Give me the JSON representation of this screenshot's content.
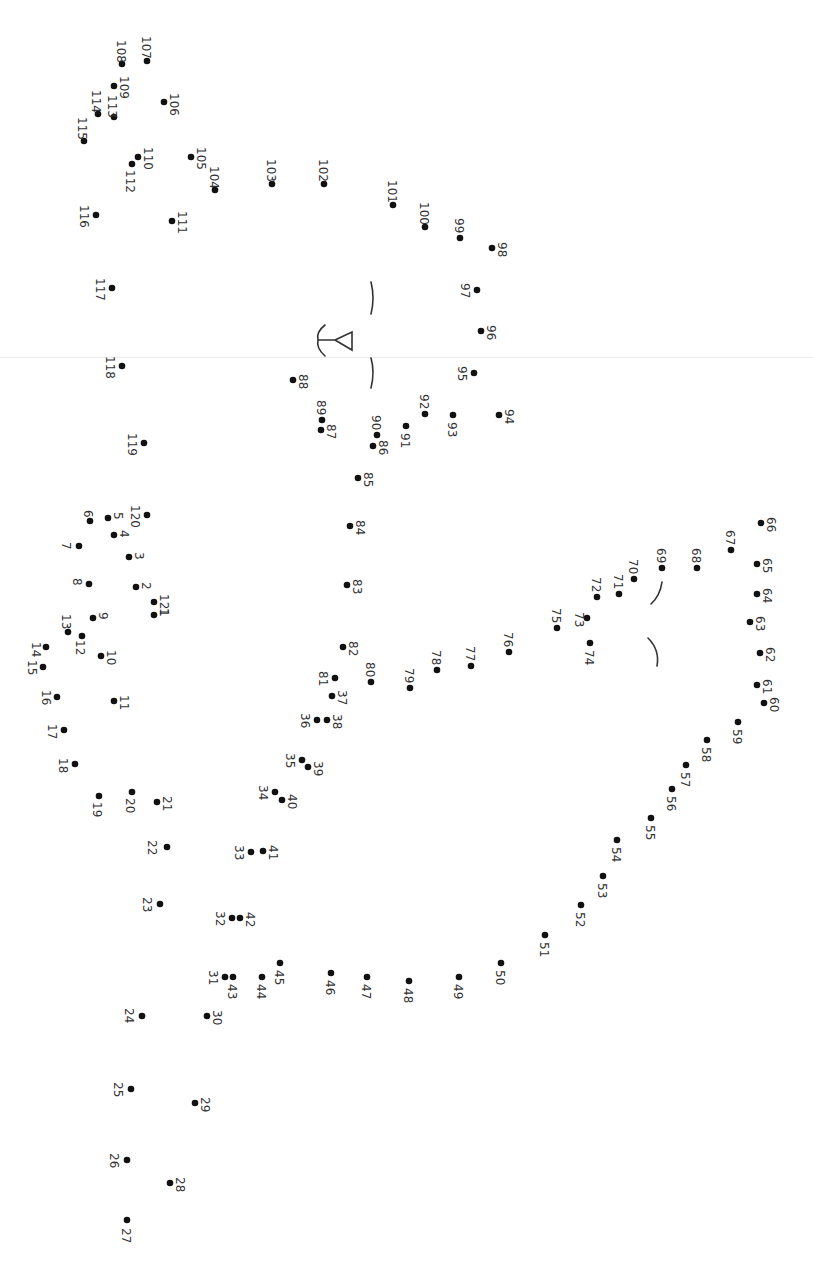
{
  "worksheet": {
    "type": "connect-the-dots",
    "orientation": "rotated-90-clockwise",
    "total_dots": 121,
    "colors": {
      "background": "#ffffff",
      "dot": "#111111",
      "label": "#333333",
      "fold_line": "#ececec"
    },
    "dots": [
      {
        "n": "1",
        "x": 154,
        "y": 615,
        "lx": 160,
        "ly": 608
      },
      {
        "n": "2",
        "x": 136,
        "y": 587,
        "lx": 142,
        "ly": 582
      },
      {
        "n": "3",
        "x": 129,
        "y": 557,
        "lx": 135,
        "ly": 552
      },
      {
        "n": "4",
        "x": 114,
        "y": 535,
        "lx": 120,
        "ly": 530
      },
      {
        "n": "5",
        "x": 108,
        "y": 518,
        "lx": 114,
        "ly": 512
      },
      {
        "n": "6",
        "x": 90,
        "y": 521,
        "lx": 84,
        "ly": 510
      },
      {
        "n": "7",
        "x": 79,
        "y": 546,
        "lx": 62,
        "ly": 542
      },
      {
        "n": "8",
        "x": 89,
        "y": 584,
        "lx": 73,
        "ly": 578
      },
      {
        "n": "9",
        "x": 93,
        "y": 618,
        "lx": 99,
        "ly": 612
      },
      {
        "n": "10",
        "x": 101,
        "y": 656,
        "lx": 107,
        "ly": 650
      },
      {
        "n": "11",
        "x": 114,
        "y": 701,
        "lx": 120,
        "ly": 695
      },
      {
        "n": "12",
        "x": 82,
        "y": 636,
        "lx": 76,
        "ly": 640
      },
      {
        "n": "13",
        "x": 68,
        "y": 632,
        "lx": 62,
        "ly": 614
      },
      {
        "n": "14",
        "x": 46,
        "y": 647,
        "lx": 32,
        "ly": 642
      },
      {
        "n": "15",
        "x": 43,
        "y": 667,
        "lx": 28,
        "ly": 660
      },
      {
        "n": "16",
        "x": 57,
        "y": 697,
        "lx": 42,
        "ly": 690
      },
      {
        "n": "17",
        "x": 64,
        "y": 730,
        "lx": 48,
        "ly": 724
      },
      {
        "n": "18",
        "x": 75,
        "y": 764,
        "lx": 59,
        "ly": 758
      },
      {
        "n": "19",
        "x": 99,
        "y": 796,
        "lx": 93,
        "ly": 802
      },
      {
        "n": "20",
        "x": 132,
        "y": 792,
        "lx": 126,
        "ly": 798
      },
      {
        "n": "21",
        "x": 157,
        "y": 802,
        "lx": 163,
        "ly": 796
      },
      {
        "n": "22",
        "x": 167,
        "y": 847,
        "lx": 148,
        "ly": 840
      },
      {
        "n": "23",
        "x": 160,
        "y": 904,
        "lx": 143,
        "ly": 897
      },
      {
        "n": "24",
        "x": 142,
        "y": 1016,
        "lx": 125,
        "ly": 1008
      },
      {
        "n": "25",
        "x": 131,
        "y": 1089,
        "lx": 114,
        "ly": 1082
      },
      {
        "n": "26",
        "x": 127,
        "y": 1160,
        "lx": 110,
        "ly": 1153
      },
      {
        "n": "27",
        "x": 127,
        "y": 1220,
        "lx": 122,
        "ly": 1228
      },
      {
        "n": "28",
        "x": 170,
        "y": 1183,
        "lx": 176,
        "ly": 1177
      },
      {
        "n": "29",
        "x": 195,
        "y": 1103,
        "lx": 201,
        "ly": 1097
      },
      {
        "n": "30",
        "x": 207,
        "y": 1016,
        "lx": 213,
        "ly": 1010
      },
      {
        "n": "31",
        "x": 225,
        "y": 977,
        "lx": 209,
        "ly": 970
      },
      {
        "n": "32",
        "x": 232,
        "y": 918,
        "lx": 216,
        "ly": 911
      },
      {
        "n": "33",
        "x": 251,
        "y": 852,
        "lx": 235,
        "ly": 845
      },
      {
        "n": "34",
        "x": 275,
        "y": 792,
        "lx": 259,
        "ly": 785
      },
      {
        "n": "35",
        "x": 302,
        "y": 760,
        "lx": 286,
        "ly": 753
      },
      {
        "n": "36",
        "x": 317,
        "y": 720,
        "lx": 301,
        "ly": 713
      },
      {
        "n": "37",
        "x": 332,
        "y": 696,
        "lx": 338,
        "ly": 690
      },
      {
        "n": "38",
        "x": 327,
        "y": 720,
        "lx": 333,
        "ly": 714
      },
      {
        "n": "39",
        "x": 308,
        "y": 767,
        "lx": 314,
        "ly": 761
      },
      {
        "n": "40",
        "x": 282,
        "y": 800,
        "lx": 288,
        "ly": 794
      },
      {
        "n": "41",
        "x": 263,
        "y": 851,
        "lx": 269,
        "ly": 845
      },
      {
        "n": "42",
        "x": 240,
        "y": 918,
        "lx": 246,
        "ly": 912
      },
      {
        "n": "43",
        "x": 233,
        "y": 977,
        "lx": 228,
        "ly": 984
      },
      {
        "n": "44",
        "x": 262,
        "y": 977,
        "lx": 257,
        "ly": 984
      },
      {
        "n": "45",
        "x": 280,
        "y": 963,
        "lx": 275,
        "ly": 970
      },
      {
        "n": "46",
        "x": 331,
        "y": 973,
        "lx": 326,
        "ly": 980
      },
      {
        "n": "47",
        "x": 367,
        "y": 977,
        "lx": 362,
        "ly": 984
      },
      {
        "n": "48",
        "x": 409,
        "y": 981,
        "lx": 404,
        "ly": 988
      },
      {
        "n": "49",
        "x": 459,
        "y": 977,
        "lx": 454,
        "ly": 984
      },
      {
        "n": "50",
        "x": 501,
        "y": 963,
        "lx": 496,
        "ly": 970
      },
      {
        "n": "51",
        "x": 545,
        "y": 935,
        "lx": 540,
        "ly": 942
      },
      {
        "n": "52",
        "x": 581,
        "y": 905,
        "lx": 576,
        "ly": 912
      },
      {
        "n": "53",
        "x": 603,
        "y": 876,
        "lx": 598,
        "ly": 883
      },
      {
        "n": "54",
        "x": 617,
        "y": 840,
        "lx": 612,
        "ly": 847
      },
      {
        "n": "55",
        "x": 651,
        "y": 818,
        "lx": 646,
        "ly": 825
      },
      {
        "n": "56",
        "x": 672,
        "y": 789,
        "lx": 667,
        "ly": 796
      },
      {
        "n": "57",
        "x": 686,
        "y": 765,
        "lx": 681,
        "ly": 772
      },
      {
        "n": "58",
        "x": 707,
        "y": 740,
        "lx": 702,
        "ly": 747
      },
      {
        "n": "59",
        "x": 738,
        "y": 722,
        "lx": 733,
        "ly": 729
      },
      {
        "n": "60",
        "x": 764,
        "y": 703,
        "lx": 770,
        "ly": 697
      },
      {
        "n": "61",
        "x": 757,
        "y": 685,
        "lx": 763,
        "ly": 679
      },
      {
        "n": "62",
        "x": 760,
        "y": 653,
        "lx": 766,
        "ly": 647
      },
      {
        "n": "63",
        "x": 750,
        "y": 622,
        "lx": 756,
        "ly": 616
      },
      {
        "n": "64",
        "x": 757,
        "y": 594,
        "lx": 763,
        "ly": 588
      },
      {
        "n": "65",
        "x": 757,
        "y": 564,
        "lx": 763,
        "ly": 558
      },
      {
        "n": "66",
        "x": 761,
        "y": 523,
        "lx": 767,
        "ly": 517
      },
      {
        "n": "67",
        "x": 731,
        "y": 550,
        "lx": 726,
        "ly": 530
      },
      {
        "n": "68",
        "x": 697,
        "y": 568,
        "lx": 692,
        "ly": 548
      },
      {
        "n": "69",
        "x": 662,
        "y": 568,
        "lx": 657,
        "ly": 548
      },
      {
        "n": "70",
        "x": 634,
        "y": 579,
        "lx": 629,
        "ly": 559
      },
      {
        "n": "71",
        "x": 619,
        "y": 594,
        "lx": 614,
        "ly": 574
      },
      {
        "n": "72",
        "x": 597,
        "y": 597,
        "lx": 592,
        "ly": 577
      },
      {
        "n": "73",
        "x": 587,
        "y": 618,
        "lx": 575,
        "ly": 612
      },
      {
        "n": "74",
        "x": 590,
        "y": 643,
        "lx": 585,
        "ly": 650
      },
      {
        "n": "75",
        "x": 557,
        "y": 628,
        "lx": 552,
        "ly": 608
      },
      {
        "n": "76",
        "x": 509,
        "y": 652,
        "lx": 504,
        "ly": 632
      },
      {
        "n": "77",
        "x": 471,
        "y": 666,
        "lx": 466,
        "ly": 646
      },
      {
        "n": "78",
        "x": 437,
        "y": 670,
        "lx": 432,
        "ly": 650
      },
      {
        "n": "79",
        "x": 410,
        "y": 688,
        "lx": 405,
        "ly": 668
      },
      {
        "n": "80",
        "x": 371,
        "y": 682,
        "lx": 366,
        "ly": 662
      },
      {
        "n": "81",
        "x": 335,
        "y": 678,
        "lx": 319,
        "ly": 671
      },
      {
        "n": "82",
        "x": 343,
        "y": 647,
        "lx": 349,
        "ly": 641
      },
      {
        "n": "83",
        "x": 347,
        "y": 585,
        "lx": 353,
        "ly": 579
      },
      {
        "n": "84",
        "x": 350,
        "y": 526,
        "lx": 356,
        "ly": 520
      },
      {
        "n": "85",
        "x": 358,
        "y": 478,
        "lx": 364,
        "ly": 472
      },
      {
        "n": "86",
        "x": 373,
        "y": 446,
        "lx": 379,
        "ly": 440
      },
      {
        "n": "87",
        "x": 321,
        "y": 430,
        "lx": 327,
        "ly": 424
      },
      {
        "n": "88",
        "x": 293,
        "y": 380,
        "lx": 299,
        "ly": 374
      },
      {
        "n": "89",
        "x": 322,
        "y": 420,
        "lx": 317,
        "ly": 400
      },
      {
        "n": "90",
        "x": 377,
        "y": 435,
        "lx": 372,
        "ly": 415
      },
      {
        "n": "91",
        "x": 406,
        "y": 426,
        "lx": 401,
        "ly": 433
      },
      {
        "n": "92",
        "x": 425,
        "y": 414,
        "lx": 420,
        "ly": 394
      },
      {
        "n": "93",
        "x": 453,
        "y": 415,
        "lx": 448,
        "ly": 422
      },
      {
        "n": "94",
        "x": 499,
        "y": 415,
        "lx": 505,
        "ly": 409
      },
      {
        "n": "95",
        "x": 474,
        "y": 373,
        "lx": 458,
        "ly": 366
      },
      {
        "n": "96",
        "x": 481,
        "y": 331,
        "lx": 487,
        "ly": 325
      },
      {
        "n": "97",
        "x": 477,
        "y": 290,
        "lx": 461,
        "ly": 283
      },
      {
        "n": "98",
        "x": 492,
        "y": 248,
        "lx": 498,
        "ly": 242
      },
      {
        "n": "99",
        "x": 460,
        "y": 238,
        "lx": 455,
        "ly": 218
      },
      {
        "n": "100",
        "x": 425,
        "y": 227,
        "lx": 420,
        "ly": 202
      },
      {
        "n": "101",
        "x": 393,
        "y": 205,
        "lx": 388,
        "ly": 180
      },
      {
        "n": "102",
        "x": 324,
        "y": 184,
        "lx": 319,
        "ly": 159
      },
      {
        "n": "103",
        "x": 272,
        "y": 184,
        "lx": 267,
        "ly": 159
      },
      {
        "n": "104",
        "x": 215,
        "y": 190,
        "lx": 210,
        "ly": 166
      },
      {
        "n": "105",
        "x": 191,
        "y": 157,
        "lx": 197,
        "ly": 147
      },
      {
        "n": "106",
        "x": 164,
        "y": 102,
        "lx": 170,
        "ly": 93
      },
      {
        "n": "107",
        "x": 147,
        "y": 61,
        "lx": 142,
        "ly": 36
      },
      {
        "n": "108",
        "x": 122,
        "y": 64,
        "lx": 117,
        "ly": 40
      },
      {
        "n": "109",
        "x": 114,
        "y": 86,
        "lx": 120,
        "ly": 76
      },
      {
        "n": "110",
        "x": 138,
        "y": 157,
        "lx": 144,
        "ly": 147
      },
      {
        "n": "111",
        "x": 172,
        "y": 221,
        "lx": 178,
        "ly": 211
      },
      {
        "n": "112",
        "x": 132,
        "y": 164,
        "lx": 126,
        "ly": 170
      },
      {
        "n": "113",
        "x": 114,
        "y": 117,
        "lx": 108,
        "ly": 95
      },
      {
        "n": "114",
        "x": 98,
        "y": 114,
        "lx": 92,
        "ly": 90
      },
      {
        "n": "115",
        "x": 84,
        "y": 141,
        "lx": 78,
        "ly": 117
      },
      {
        "n": "116",
        "x": 96,
        "y": 215,
        "lx": 80,
        "ly": 205
      },
      {
        "n": "117",
        "x": 112,
        "y": 288,
        "lx": 96,
        "ly": 278
      },
      {
        "n": "118",
        "x": 122,
        "y": 366,
        "lx": 106,
        "ly": 356
      },
      {
        "n": "119",
        "x": 144,
        "y": 443,
        "lx": 128,
        "ly": 433
      },
      {
        "n": "120",
        "x": 147,
        "y": 515,
        "lx": 131,
        "ly": 505
      },
      {
        "n": "121",
        "x": 154,
        "y": 602,
        "lx": 160,
        "ly": 594
      }
    ],
    "drawn_strokes": [
      {
        "name": "eyebrow-upper-stroke",
        "d": "M371 282 Q375 298 371 314"
      },
      {
        "name": "eyebrow-lower-stroke",
        "d": "M371 358 Q375 372 371 388"
      },
      {
        "name": "nose-mouth-stroke",
        "d": "M325 325 Q316 332 318 340 M318 340 L335 340 M318 340 Q316 348 325 356 M335 340 L352 332 L352 350 Z"
      },
      {
        "name": "beak-curve-upper-stroke",
        "d": "M662 582 Q660 596 651 604"
      },
      {
        "name": "beak-curve-lower-stroke",
        "d": "M648 638 Q660 650 657 666"
      }
    ]
  }
}
